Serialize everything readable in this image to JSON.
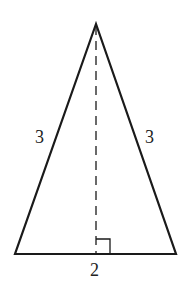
{
  "figure": {
    "type": "isosceles triangle with altitude",
    "side_labels": {
      "left": "3",
      "right": "3",
      "base": "2"
    },
    "right_angle_marker": true,
    "altitude_style": "dashed"
  },
  "colors": {
    "stroke": "#1a1a1a",
    "background": "#ffffff"
  }
}
